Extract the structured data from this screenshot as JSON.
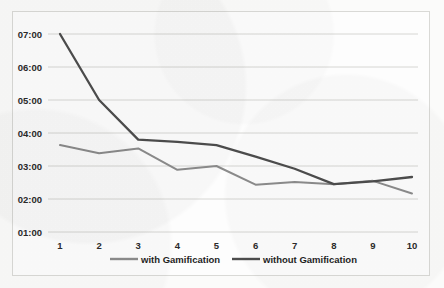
{
  "chart_data": {
    "type": "line",
    "title": "",
    "subtitle": "",
    "xlabel": "",
    "ylabel": "",
    "categories": [
      "1",
      "2",
      "3",
      "4",
      "5",
      "6",
      "7",
      "8",
      "9",
      "10"
    ],
    "x": [
      1,
      2,
      3,
      4,
      5,
      6,
      7,
      8,
      9,
      10
    ],
    "ytick_labels": [
      "01:00",
      "02:00",
      "03:00",
      "04:00",
      "05:00",
      "06:00",
      "07:00"
    ],
    "ytick_values": [
      60,
      120,
      180,
      240,
      300,
      360,
      420
    ],
    "ylim": [
      60,
      420
    ],
    "xlim": [
      1,
      10
    ],
    "y_value_unit": "mm:ss",
    "grid": "horizontal",
    "legend_position": "bottom",
    "series": [
      {
        "name": "with Gamification",
        "color": "#8c8c8c",
        "values_label": [
          "03:38",
          "03:23",
          "03:32",
          "02:53",
          "03:00",
          "02:26",
          "02:31",
          "02:27",
          "02:33",
          "02:10"
        ],
        "values": [
          218,
          203,
          212,
          173,
          180,
          146,
          151,
          147,
          153,
          130
        ]
      },
      {
        "name": "without Gamification",
        "color": "#4d4d4d",
        "values_label": [
          "07:00",
          "05:00",
          "03:48",
          "03:44",
          "03:38",
          "03:17",
          "02:55",
          "02:27",
          "02:32",
          "02:40"
        ],
        "values": [
          420,
          300,
          228,
          224,
          218,
          197,
          175,
          147,
          152,
          160
        ]
      }
    ]
  },
  "legend": {
    "items": [
      {
        "label": "with Gamification",
        "color": "#8c8c8c"
      },
      {
        "label": "without Gamification",
        "color": "#4d4d4d"
      }
    ]
  },
  "colors": {
    "series_light": "#8c8c8c",
    "series_dark": "#4d4d4d",
    "gridline": "#d6d6d3",
    "frame_border": "#d9d9d6",
    "tick_text": "#2b2b2b",
    "page_background": "#fbfbfa"
  }
}
